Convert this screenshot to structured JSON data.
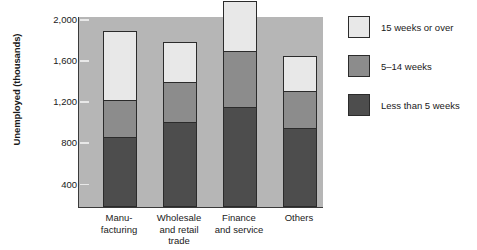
{
  "chart_data": {
    "type": "bar",
    "title": "",
    "xlabel": "",
    "ylabel": "Unemployed (thousands)",
    "categories": [
      "Manu-\nfacturing",
      "Wholesale\nand retail\ntrade",
      "Finance\nand service",
      "Others"
    ],
    "category_labels": [
      [
        "Manu-",
        "facturing"
      ],
      [
        "Wholesale",
        "and retail",
        "trade"
      ],
      [
        "Finance",
        "and service"
      ],
      [
        "Others"
      ]
    ],
    "stacked": true,
    "ylim": [
      230,
      2090
    ],
    "yticks": [
      400,
      800,
      1200,
      1600,
      2000
    ],
    "ytick_labels": [
      "400",
      "800",
      "1,200",
      "1,600",
      "2,000"
    ],
    "grid": false,
    "legend_position": "right",
    "series": [
      {
        "name": "Less than 5 weeks",
        "color": "#4d4d4d",
        "values": [
          670,
          820,
          960,
          760
        ]
      },
      {
        "name": "5–14 weeks",
        "color": "#8c8c8c",
        "values": [
          360,
          390,
          550,
          360
        ]
      },
      {
        "name": "15 weeks or over",
        "color": "#e8e8e8",
        "values": [
          660,
          380,
          480,
          330
        ]
      }
    ],
    "totals": [
      1690,
      1590,
      1990,
      1450
    ],
    "plot_background": "#b6b6b6"
  },
  "legend": {
    "items": [
      {
        "label": "15 weeks or over",
        "color": "#e8e8e8"
      },
      {
        "label": "5–14 weeks",
        "color": "#8c8c8c"
      },
      {
        "label": "Less than 5 weeks",
        "color": "#4d4d4d"
      }
    ]
  },
  "axis": {
    "y_title": "Unemployed (thousands)",
    "y_ticks": [
      "2,000",
      "1,600",
      "1,200",
      "800",
      "400"
    ]
  },
  "caption": {
    "text": ""
  }
}
